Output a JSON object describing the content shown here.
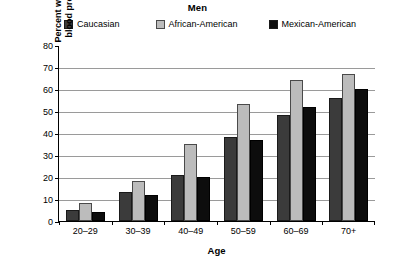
{
  "chart_data": {
    "type": "bar",
    "title": "Men",
    "xlabel": "Age",
    "ylabel": "Percent with high blood pressure",
    "ylabel_lines": [
      "Percent with high",
      "blood pressure"
    ],
    "categories": [
      "20–29",
      "30–39",
      "40–49",
      "50–59",
      "60–69",
      "70+"
    ],
    "series": [
      {
        "name": "Caucasian",
        "color": "#3b3b3b",
        "values": [
          5,
          13,
          21,
          38,
          48,
          56
        ]
      },
      {
        "name": "African-American",
        "color": "#bcbcbc",
        "values": [
          8,
          18,
          35,
          53,
          64,
          67
        ]
      },
      {
        "name": "Mexican-American",
        "color": "#0d0d0d",
        "values": [
          4,
          12,
          20,
          37,
          52,
          60
        ]
      }
    ],
    "ylim": [
      0,
      80
    ],
    "yticks": [
      0,
      10,
      20,
      30,
      40,
      50,
      60,
      70,
      80
    ],
    "ytick_labels": [
      "0",
      "10",
      "20",
      "30",
      "40",
      "50",
      "60",
      "70",
      "80"
    ],
    "grid": true,
    "legend_position": "top"
  }
}
